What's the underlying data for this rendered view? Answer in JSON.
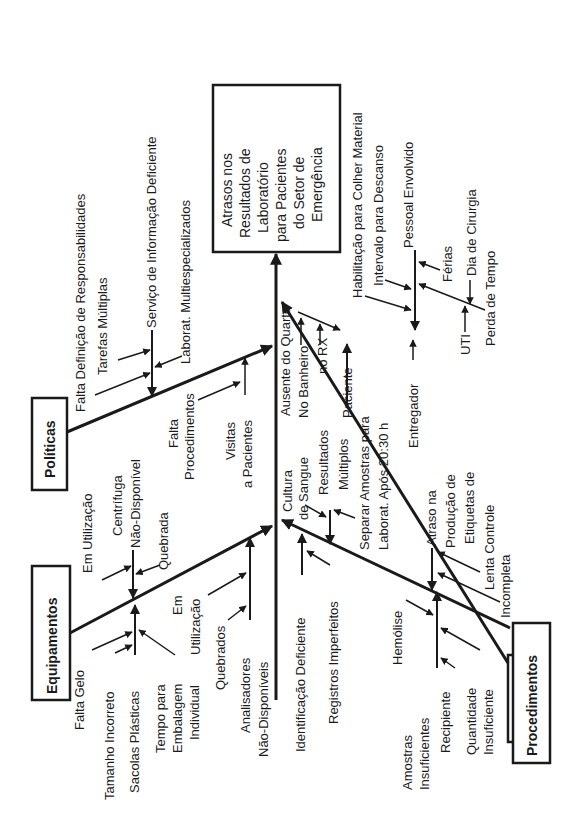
{
  "effect": {
    "lines": [
      "Atrasos nos",
      "Resultados de",
      "Laboratório",
      "para Pacientes",
      "do Setor de",
      "Emergência"
    ]
  },
  "categories": {
    "politicas": {
      "label": "Políticas",
      "causes": {
        "falta_definicao": "Falta Definição de Responsabilidades",
        "tarefas_multiplas": "Tarefas Múltiplas",
        "servico_informacao": "Serviço de Informação Deficiente",
        "laborat_multiesp": "Laborat. Multiespecializados",
        "falta_proc_1": "Falta",
        "falta_proc_2": "Procedimentos",
        "visitas_1": "Visitas",
        "visitas_2": "a Pacientes"
      }
    },
    "equipamentos": {
      "label": "Equipamentos",
      "causes": {
        "em_utilizacao_1": "Em Utilização",
        "centrifuga": "Centrífuga",
        "nao_disponivel_1": "Não-Disponível",
        "quebrada": "Quebrada",
        "falta_gelo": "Falta Gelo",
        "tamanho_incorreto": "Tamanho Incorreto",
        "sacolas_plasticas": "Sacolas Plásticas",
        "tempo_1": "Tempo para",
        "tempo_2": "Embalagem",
        "tempo_3": "Individual",
        "em_2": "Em",
        "utilizacao_2": "Utilização",
        "quebrados": "Quebrados",
        "analisadores": "Analisadores",
        "nao_disponiveis": "Não-Disponíveis"
      }
    },
    "pessoal": {
      "label": "Pessoal",
      "causes": {
        "ausente_quarto": "Ausente do Quarto",
        "no_banheiro": "No Banheiro",
        "no_rx": "no RX",
        "paciente": "Paciente",
        "habilitacao": "Habilitação para Colher Material",
        "intervalo": "Intervalo para Descanso",
        "pessoal_envolvido": "Pessoal Envolvido",
        "ferias": "Férias",
        "dia_cirurgia": "Dia de Cirurgia",
        "perda_tempo": "Perda de Tempo",
        "uti": "UTI",
        "entregador": "Entregador"
      }
    },
    "procedimentos": {
      "label": "Procedimentos",
      "causes": {
        "cultura_1": "Cultura",
        "cultura_2": "de Sangue",
        "resultados_1": "Resultados",
        "resultados_2": "Múltiplos",
        "separar_1": "Separar Amostras para",
        "separar_2": "Laborat. Após 20:30 h",
        "identificacao": "Identificação Deficiente",
        "registros": "Registros Imperfeitos",
        "hemolise": "Hemólise",
        "amostras_1": "Amostras",
        "amostras_2": "Insuficientes",
        "recipiente": "Recipiente",
        "quantidade_1": "Quantidade",
        "quantidade_2": "Insuficiente",
        "atraso_1": "Atraso na",
        "atraso_2": "Produção de",
        "atraso_3": "Etiquetas de",
        "lenta_controle": "Lenta Controle",
        "incompleta": "Incompleta"
      }
    }
  },
  "colors": {
    "ink": "#1a1a1a",
    "background": "#ffffff"
  }
}
